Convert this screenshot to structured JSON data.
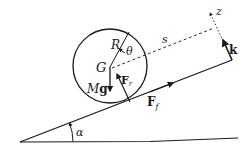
{
  "diagram": {
    "colors": {
      "ink": "#1a1a1a",
      "background": "#ffffff"
    },
    "labels": {
      "center": "G",
      "radius": "R",
      "angle_theta": "θ",
      "weight_M": "M",
      "weight_g": "g",
      "normal_force_F": "F",
      "normal_force_sub": "r",
      "friction_force_F": "F",
      "friction_force_sub": "f",
      "distance": "s",
      "axis_z": "z",
      "unit_vector": "k",
      "incline_angle": "α"
    }
  }
}
